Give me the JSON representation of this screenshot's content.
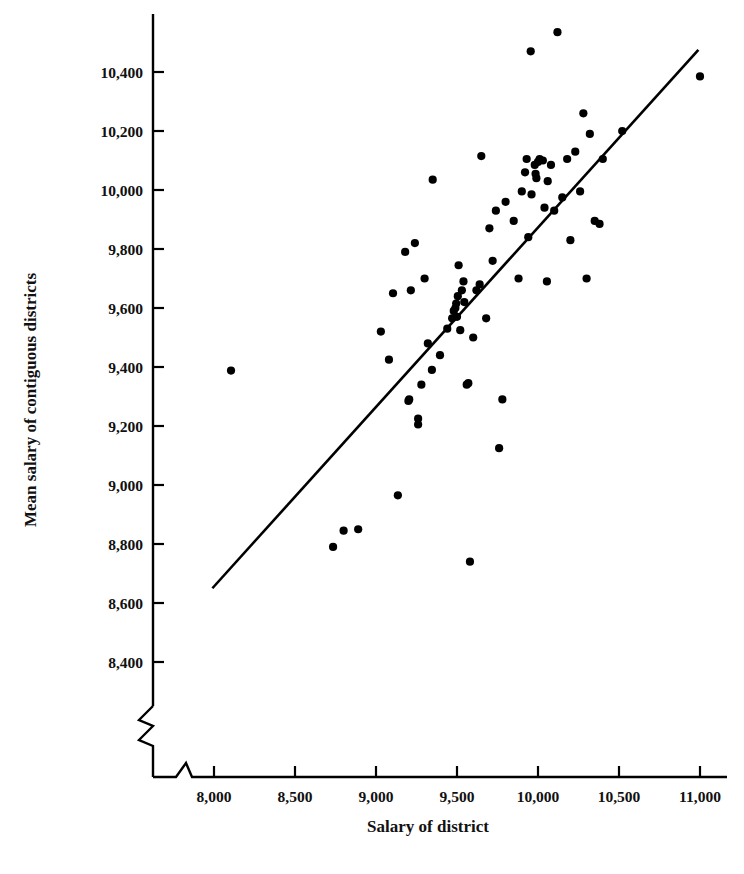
{
  "chart_data": {
    "type": "scatter",
    "title": "",
    "xlabel": "Salary of district",
    "ylabel": "Mean salary of contiguous districts",
    "xlim": [
      7850,
      11250
    ],
    "ylim": [
      8330,
      10520
    ],
    "grid": false,
    "legend": null,
    "axis_break": {
      "x": true,
      "y": true,
      "note": "zigzag break symbols near origin on both axes"
    },
    "xticks": [
      8000,
      8500,
      9000,
      9500,
      10000,
      10500,
      11000
    ],
    "xticklabels": [
      "8,000",
      "8,500",
      "9,000",
      "9,500",
      "10,000",
      "10,500",
      "11,000"
    ],
    "yticks": [
      8400,
      8600,
      8800,
      9000,
      9200,
      9400,
      9600,
      9800,
      10000,
      10200,
      10400
    ],
    "yticklabels": [
      "8,400",
      "8,600",
      "8,800",
      "9,000",
      "9,200",
      "9,400",
      "9,600",
      "9,800",
      "10,000",
      "10,200",
      "10,400"
    ],
    "series": [
      {
        "name": "districts",
        "marker": "filled-circle",
        "color": "#000000",
        "points": [
          [
            8105,
            9388
          ],
          [
            8735,
            8790
          ],
          [
            8800,
            8845
          ],
          [
            8890,
            8850
          ],
          [
            9030,
            9520
          ],
          [
            9080,
            9425
          ],
          [
            9105,
            9650
          ],
          [
            9135,
            8965
          ],
          [
            9180,
            9790
          ],
          [
            9200,
            9285
          ],
          [
            9205,
            9290
          ],
          [
            9215,
            9660
          ],
          [
            9240,
            9820
          ],
          [
            9260,
            9205
          ],
          [
            9260,
            9225
          ],
          [
            9280,
            9340
          ],
          [
            9300,
            9700
          ],
          [
            9320,
            9480
          ],
          [
            9345,
            9390
          ],
          [
            9350,
            10035
          ],
          [
            9395,
            9440
          ],
          [
            9440,
            9530
          ],
          [
            9470,
            9565
          ],
          [
            9480,
            9590
          ],
          [
            9490,
            9600
          ],
          [
            9495,
            9615
          ],
          [
            9500,
            9570
          ],
          [
            9505,
            9640
          ],
          [
            9510,
            9745
          ],
          [
            9520,
            9525
          ],
          [
            9530,
            9660
          ],
          [
            9540,
            9690
          ],
          [
            9545,
            9620
          ],
          [
            9560,
            9340
          ],
          [
            9570,
            9345
          ],
          [
            9580,
            8740
          ],
          [
            9600,
            9500
          ],
          [
            9620,
            9660
          ],
          [
            9640,
            9680
          ],
          [
            9650,
            10115
          ],
          [
            9680,
            9565
          ],
          [
            9700,
            9870
          ],
          [
            9720,
            9760
          ],
          [
            9740,
            9930
          ],
          [
            9760,
            9125
          ],
          [
            9780,
            9290
          ],
          [
            9800,
            9960
          ],
          [
            9850,
            9895
          ],
          [
            9880,
            9700
          ],
          [
            9900,
            9995
          ],
          [
            9920,
            10060
          ],
          [
            9930,
            10105
          ],
          [
            9940,
            9840
          ],
          [
            9955,
            10470
          ],
          [
            9960,
            9985
          ],
          [
            9980,
            10085
          ],
          [
            9985,
            10055
          ],
          [
            9990,
            10040
          ],
          [
            10000,
            10095
          ],
          [
            10010,
            10105
          ],
          [
            10030,
            10100
          ],
          [
            10040,
            9940
          ],
          [
            10055,
            9690
          ],
          [
            10060,
            10030
          ],
          [
            10080,
            10085
          ],
          [
            10100,
            9930
          ],
          [
            10120,
            10535
          ],
          [
            10150,
            9975
          ],
          [
            10180,
            10105
          ],
          [
            10200,
            9830
          ],
          [
            10230,
            10130
          ],
          [
            10260,
            9995
          ],
          [
            10280,
            10260
          ],
          [
            10300,
            9700
          ],
          [
            10320,
            10190
          ],
          [
            10350,
            9895
          ],
          [
            10380,
            9885
          ],
          [
            10400,
            10105
          ],
          [
            10520,
            10200
          ],
          [
            11000,
            10385
          ]
        ]
      }
    ],
    "fit_line": {
      "name": "regression line",
      "color": "#000000",
      "x_start": 7990,
      "y_start": 8650,
      "x_end": 10990,
      "y_end": 10475
    }
  }
}
